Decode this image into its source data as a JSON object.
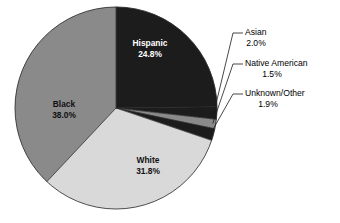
{
  "chart_data": {
    "type": "pie",
    "title": "",
    "subtitle": "",
    "xlabel": "",
    "ylabel": "",
    "grid": false,
    "legend_position": "none",
    "label_format": "name + percent",
    "start_angle_deg": 0,
    "direction": "clockwise",
    "total_percent": "100.0",
    "categories": [
      "Hispanic",
      "Asian",
      "Native American",
      "Unknown/Other",
      "White",
      "Black"
    ],
    "values": [
      24.8,
      2.0,
      1.5,
      1.9,
      31.8,
      38.0
    ],
    "slices": [
      {
        "name": "Hispanic",
        "percent": 24.8,
        "percent_label": "24.8%",
        "color": "#1c1c1c",
        "label_color": "#ffffff",
        "label_placement": "inside",
        "callout": false
      },
      {
        "name": "Asian",
        "percent": 2.0,
        "percent_label": "2.0%",
        "color": "#1c1c1c",
        "label_color": "#000000",
        "label_placement": "callout",
        "callout": true
      },
      {
        "name": "Native American",
        "percent": 1.5,
        "percent_label": "1.5%",
        "color": "#8a8a8a",
        "label_color": "#000000",
        "label_placement": "callout",
        "callout": true
      },
      {
        "name": "Unknown/Other",
        "percent": 1.9,
        "percent_label": "1.9%",
        "color": "#1c1c1c",
        "label_color": "#000000",
        "label_placement": "callout",
        "callout": true
      },
      {
        "name": "White",
        "percent": 31.8,
        "percent_label": "31.8%",
        "color": "#d9d9d9",
        "label_color": "#111111",
        "label_placement": "inside",
        "callout": false
      },
      {
        "name": "Black",
        "percent": 38.0,
        "percent_label": "38.0%",
        "color": "#8a8a8a",
        "label_color": "#111111",
        "label_placement": "inside",
        "callout": false
      }
    ],
    "colors": {
      "dark": "#1c1c1c",
      "medium_gray": "#8a8a8a",
      "light_gray": "#d9d9d9",
      "background": "#ffffff",
      "outline": "#2a2a2a",
      "text_dark": "#000000",
      "text_light": "#ffffff"
    },
    "geometry": {
      "center_x": 116,
      "center_y": 108,
      "radius": 101
    }
  },
  "inside_labels": [
    {
      "name": "Hispanic",
      "percent_label": "24.8%",
      "x": 150,
      "y": 44
    },
    {
      "name": "Black",
      "percent_label": "38.0%",
      "x": 64,
      "y": 105
    },
    {
      "name": "White",
      "percent_label": "31.8%",
      "x": 148,
      "y": 161
    }
  ],
  "callout_labels": [
    {
      "name": "Asian",
      "percent_label": "2.0%",
      "text_x": 245,
      "text_y": 33,
      "pct_x": 256,
      "pct_y": 44
    },
    {
      "name": "Native American",
      "percent_label": "1.5%",
      "text_x": 245,
      "text_y": 64,
      "pct_x": 272,
      "pct_y": 75
    },
    {
      "name": "Unknown/Other",
      "percent_label": "1.9%",
      "text_x": 245,
      "text_y": 94,
      "pct_x": 268,
      "pct_y": 105
    }
  ]
}
